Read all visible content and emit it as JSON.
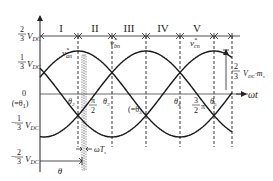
{
  "sectors": [
    "I",
    "II",
    "III",
    "IV",
    "V"
  ],
  "y_labels": {
    "pos_two_thirds": {
      "num": "2",
      "den": "3",
      "unit": "V",
      "sub": "DC",
      "sign": ""
    },
    "pos_one_third": {
      "num": "1",
      "den": "3",
      "unit": "V",
      "sub": "DC",
      "sign": ""
    },
    "zero": "0",
    "zero_eq": "(=θ",
    "zero_eq_sub": "1",
    "zero_eq_close": ")",
    "neg_one_third": {
      "num": "1",
      "den": "3",
      "unit": "V",
      "sub": "DC",
      "sign": "−"
    },
    "neg_two_thirds": {
      "num": "2",
      "den": "3",
      "unit": "V",
      "sub": "DC",
      "sign": "−"
    }
  },
  "curves": [
    {
      "name": "v*an",
      "label": "v",
      "sup": "*",
      "sub": "an",
      "phase_deg": 0
    },
    {
      "name": "v*bn",
      "label": "v",
      "sup": "*",
      "sub": "bn",
      "phase_deg": -120
    },
    {
      "name": "v*cn",
      "label": "v",
      "sup": "*",
      "sub": "cn",
      "phase_deg": 120
    }
  ],
  "x_labels": {
    "theta2": {
      "sym": "θ",
      "sub": "2"
    },
    "pi_half": {
      "num": "π",
      "den": "2"
    },
    "theta3": {
      "sym": "θ",
      "sub": "3"
    },
    "theta3_eq": "(=θ",
    "theta3_eq_sub": "3",
    "theta4": {
      "sym": "θ",
      "sub": "4"
    },
    "three_half_pi": {
      "num": "3",
      "den": "2",
      "suffix": "π"
    },
    "theta5": {
      "sym": "θ",
      "sub": "5"
    }
  },
  "x_axis_label": {
    "sym": "ω",
    "rest": "t"
  },
  "omega_ts": {
    "sym": "ωT",
    "sub": "s"
  },
  "theta_bracket": "θ",
  "amplitude_label": {
    "num": "2",
    "den": "3",
    "unit": "V",
    "sub": "DC",
    "suffix": "·m",
    "suffix_sub": "s"
  },
  "colors": {
    "line": "#1a1a1a",
    "text": "#222222",
    "background": "#ffffff"
  }
}
